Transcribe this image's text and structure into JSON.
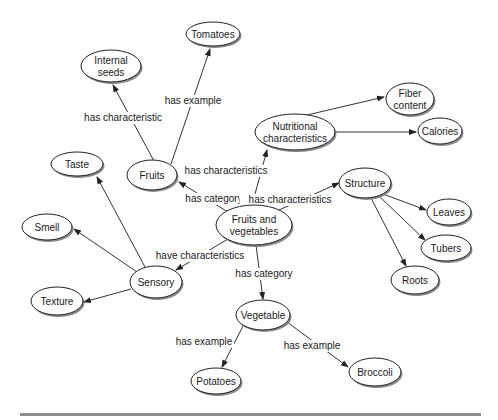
{
  "diagram": {
    "type": "concept-map",
    "central_concept": "Fruits and vegetables",
    "nodes": [
      {
        "id": "fv",
        "label_lines": [
          "Fruits and",
          "vegetables"
        ],
        "cx": 254,
        "cy": 225,
        "rx": 38,
        "ry": 20
      },
      {
        "id": "fruits",
        "label_lines": [
          "Fruits"
        ],
        "cx": 152,
        "cy": 175,
        "rx": 25,
        "ry": 15
      },
      {
        "id": "internal_seeds",
        "label_lines": [
          "Internal",
          "seeds"
        ],
        "cx": 111,
        "cy": 66,
        "rx": 30,
        "ry": 16
      },
      {
        "id": "tomatoes",
        "label_lines": [
          "Tomatoes"
        ],
        "cx": 213,
        "cy": 34,
        "rx": 27,
        "ry": 12
      },
      {
        "id": "nutritional",
        "label_lines": [
          "Nutritional",
          "characteristics"
        ],
        "cx": 295,
        "cy": 132,
        "rx": 40,
        "ry": 18
      },
      {
        "id": "fiber",
        "label_lines": [
          "Fiber",
          "content"
        ],
        "cx": 410,
        "cy": 99,
        "rx": 24,
        "ry": 16
      },
      {
        "id": "calories",
        "label_lines": [
          "Calories"
        ],
        "cx": 440,
        "cy": 131,
        "rx": 22,
        "ry": 13
      },
      {
        "id": "structure",
        "label_lines": [
          "Structure"
        ],
        "cx": 365,
        "cy": 183,
        "rx": 26,
        "ry": 15
      },
      {
        "id": "leaves",
        "label_lines": [
          "Leaves"
        ],
        "cx": 449,
        "cy": 212,
        "rx": 22,
        "ry": 13
      },
      {
        "id": "tubers",
        "label_lines": [
          "Tubers"
        ],
        "cx": 446,
        "cy": 248,
        "rx": 25,
        "ry": 13
      },
      {
        "id": "roots",
        "label_lines": [
          "Roots"
        ],
        "cx": 415,
        "cy": 280,
        "rx": 24,
        "ry": 14
      },
      {
        "id": "taste",
        "label_lines": [
          "Taste"
        ],
        "cx": 77,
        "cy": 164,
        "rx": 26,
        "ry": 12
      },
      {
        "id": "smell",
        "label_lines": [
          "Smell"
        ],
        "cx": 47,
        "cy": 227,
        "rx": 25,
        "ry": 13
      },
      {
        "id": "sensory",
        "label_lines": [
          "Sensory"
        ],
        "cx": 156,
        "cy": 282,
        "rx": 26,
        "ry": 16
      },
      {
        "id": "texture",
        "label_lines": [
          "Texture"
        ],
        "cx": 57,
        "cy": 301,
        "rx": 26,
        "ry": 14
      },
      {
        "id": "vegetable",
        "label_lines": [
          "Vegetable"
        ],
        "cx": 263,
        "cy": 315,
        "rx": 27,
        "ry": 15
      },
      {
        "id": "potatoes",
        "label_lines": [
          "Potatoes"
        ],
        "cx": 216,
        "cy": 381,
        "rx": 25,
        "ry": 13
      },
      {
        "id": "broccoli",
        "label_lines": [
          "Broccoli"
        ],
        "cx": 375,
        "cy": 372,
        "rx": 26,
        "ry": 14
      }
    ],
    "edges": [
      {
        "from": "fv",
        "to": "fruits",
        "label": "has category",
        "x1": 228,
        "y1": 212,
        "x2": 179,
        "y2": 182,
        "lx": 214,
        "ly": 202
      },
      {
        "from": "fruits",
        "to": "internal_seeds",
        "label": "has characteristic",
        "x1": 154,
        "y1": 161,
        "x2": 113,
        "y2": 85,
        "lx": 123,
        "ly": 121
      },
      {
        "from": "fruits",
        "to": "tomatoes",
        "label": "has example",
        "x1": 171,
        "y1": 164,
        "x2": 210,
        "y2": 49,
        "lx": 193,
        "ly": 104
      },
      {
        "from": "fv",
        "to": "nutritional",
        "label": "has characteristics",
        "x1": 252,
        "y1": 205,
        "x2": 267,
        "y2": 150,
        "lx": 226,
        "ly": 174
      },
      {
        "from": "nutritional",
        "to": "fiber",
        "label": "",
        "x1": 307,
        "y1": 115,
        "x2": 384,
        "y2": 97
      },
      {
        "from": "nutritional",
        "to": "calories",
        "label": "",
        "x1": 336,
        "y1": 132,
        "x2": 416,
        "y2": 132
      },
      {
        "from": "fv",
        "to": "structure",
        "label": "has characteristics",
        "x1": 279,
        "y1": 210,
        "x2": 339,
        "y2": 183,
        "lx": 290,
        "ly": 203
      },
      {
        "from": "structure",
        "to": "leaves",
        "label": "",
        "x1": 383,
        "y1": 194,
        "x2": 426,
        "y2": 210
      },
      {
        "from": "structure",
        "to": "tubers",
        "label": "",
        "x1": 380,
        "y1": 197,
        "x2": 425,
        "y2": 240
      },
      {
        "from": "structure",
        "to": "roots",
        "label": "",
        "x1": 371,
        "y1": 198,
        "x2": 406,
        "y2": 266
      },
      {
        "from": "fv",
        "to": "sensory",
        "label": "have characteristics",
        "x1": 228,
        "y1": 239,
        "x2": 176,
        "y2": 270,
        "lx": 200,
        "ly": 259
      },
      {
        "from": "sensory",
        "to": "taste",
        "label": "",
        "x1": 145,
        "y1": 267,
        "x2": 97,
        "y2": 177
      },
      {
        "from": "sensory",
        "to": "smell",
        "label": "",
        "x1": 137,
        "y1": 272,
        "x2": 74,
        "y2": 229
      },
      {
        "from": "sensory",
        "to": "texture",
        "label": "",
        "x1": 131,
        "y1": 289,
        "x2": 84,
        "y2": 302
      },
      {
        "from": "fv",
        "to": "vegetable",
        "label": "has category",
        "x1": 256,
        "y1": 245,
        "x2": 263,
        "y2": 299,
        "lx": 264,
        "ly": 277
      },
      {
        "from": "vegetable",
        "to": "potatoes",
        "label": "has example",
        "x1": 243,
        "y1": 326,
        "x2": 222,
        "y2": 367,
        "lx": 204,
        "ly": 345
      },
      {
        "from": "vegetable",
        "to": "broccoli",
        "label": "has example",
        "x1": 287,
        "y1": 322,
        "x2": 348,
        "y2": 367,
        "lx": 312,
        "ly": 349
      }
    ]
  },
  "colors": {
    "node_fill": "#ffffff",
    "node_stroke": "#222222",
    "shadow": "#8a8a8a",
    "edge": "#333333",
    "rule": "#8c8c8c"
  }
}
